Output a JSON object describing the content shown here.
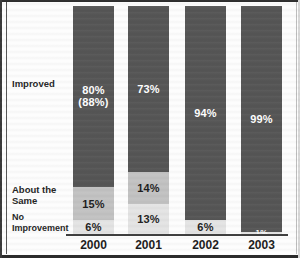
{
  "chart_data": {
    "type": "bar",
    "subtype": "stacked-bar-100-percent",
    "title": "",
    "xlabel": "",
    "ylabel": "",
    "ylim": [
      0,
      100
    ],
    "grid": false,
    "legend_position": "left-row-labels",
    "categories": [
      "2000",
      "2001",
      "2002",
      "2003"
    ],
    "series": [
      {
        "name": "Improved",
        "values": [
          80,
          73,
          94,
          99
        ],
        "color": "#565656"
      },
      {
        "name": "About the Same",
        "values": [
          15,
          14,
          0,
          0
        ],
        "color": "#c2c2c2"
      },
      {
        "name": "No Improvement",
        "values": [
          6,
          13,
          6,
          1
        ],
        "color": "#e4e4e4"
      }
    ],
    "annotations": [
      {
        "text": "(88%)",
        "category": "2000",
        "series": "Improved"
      }
    ]
  },
  "rows": {
    "improved": "Improved",
    "about_the_same_line1": "About the",
    "about_the_same_line2": "Same",
    "no_improvement_line1": "No",
    "no_improvement_line2": "Improvement"
  },
  "columns": [
    {
      "year": "2000",
      "improved_label": "80%",
      "improved_note": "(88%)",
      "same_label": "15%",
      "none_label": "6%"
    },
    {
      "year": "2001",
      "improved_label": "73%",
      "improved_note": "",
      "same_label": "14%",
      "none_label": "13%"
    },
    {
      "year": "2002",
      "improved_label": "94%",
      "improved_note": "",
      "same_label": "",
      "none_label": "6%"
    },
    {
      "year": "2003",
      "improved_label": "99%",
      "improved_note": "",
      "same_label": "",
      "none_label": "1%"
    }
  ],
  "colors": {
    "improved": "#565656",
    "about_the_same": "#c2c2c2",
    "no_improvement": "#e4e4e4",
    "axis": "#3b3b3b",
    "text_dark": "#1c1c1c",
    "text_light": "#ffffff"
  }
}
